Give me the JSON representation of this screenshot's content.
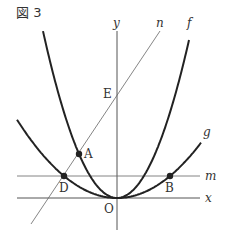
{
  "figure": {
    "title": "図 3"
  },
  "labels": {
    "y_axis": "y",
    "x_axis": "x",
    "line_n": "n",
    "line_m": "m",
    "curve_f": "f",
    "curve_g": "g",
    "origin": "O",
    "point_A": "A",
    "point_B": "B",
    "point_D": "D",
    "point_E": "E"
  }
}
